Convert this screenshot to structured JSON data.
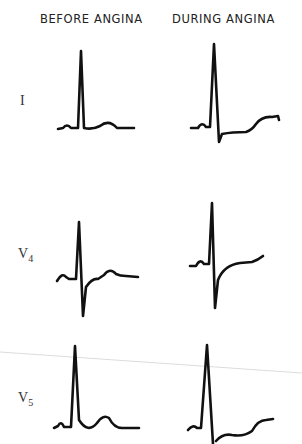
{
  "headers": {
    "before": "BEFORE ANGINA",
    "during": "DURING ANGINA"
  },
  "leads": [
    {
      "name": "I",
      "sub": ""
    },
    {
      "name": "V",
      "sub": "4"
    },
    {
      "name": "V",
      "sub": "5"
    }
  ],
  "colors": {
    "trace": "#111111",
    "artifact_line": "#d8d8d8",
    "text": "#222222"
  }
}
